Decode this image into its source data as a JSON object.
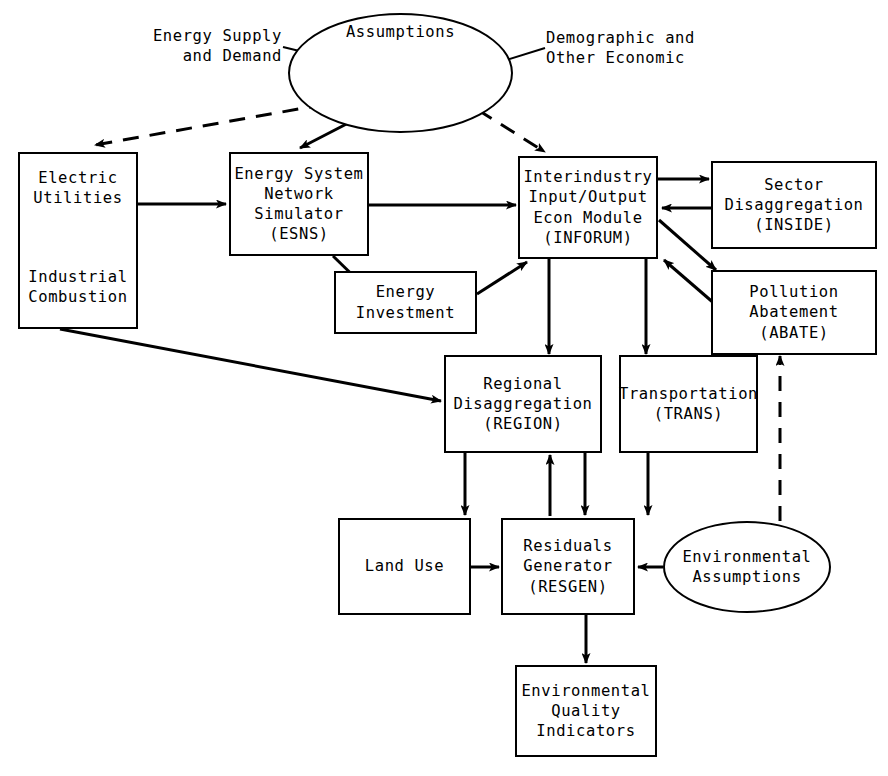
{
  "diagram": {
    "nodes": {
      "assumptions": {
        "label": "Assumptions"
      },
      "energy_supply_label": {
        "label": "Energy Supply\nand Demand"
      },
      "demographic_label": {
        "label": "Demographic and\nOther Economic"
      },
      "electric_utilities": {
        "top": "Electric\nUtilities",
        "bottom": "Industrial\nCombustion"
      },
      "esns": {
        "label": "Energy System\nNetwork\nSimulator\n(ESNS)"
      },
      "inforum": {
        "label": "Interindustry\nInput/Output\nEcon Module\n(INFORUM)"
      },
      "inside": {
        "label": "Sector\nDisaggregation\n(INSIDE)"
      },
      "abate": {
        "label": "Pollution\nAbatement\n(ABATE)"
      },
      "energy_investment": {
        "label": "Energy\nInvestment"
      },
      "region": {
        "label": "Regional\nDisaggregation\n(REGION)"
      },
      "trans": {
        "label": "Transportation\n(TRANS)"
      },
      "land_use": {
        "label": "Land Use"
      },
      "resgen": {
        "label": "Residuals\nGenerator\n(RESGEN)"
      },
      "env_assumptions": {
        "label": "Environmental\nAssumptions"
      },
      "eqi": {
        "label": "Environmental\nQuality\nIndicators"
      }
    },
    "edges": [
      {
        "from": "energy_supply_label",
        "to": "assumptions",
        "style": "solid-leader"
      },
      {
        "from": "demographic_label",
        "to": "assumptions",
        "style": "solid-leader"
      },
      {
        "from": "assumptions",
        "to": "electric_utilities",
        "style": "dashed"
      },
      {
        "from": "assumptions",
        "to": "esns",
        "style": "solid"
      },
      {
        "from": "assumptions",
        "to": "inforum",
        "style": "dashed"
      },
      {
        "from": "electric_utilities",
        "to": "esns",
        "style": "solid"
      },
      {
        "from": "electric_utilities",
        "to": "region",
        "style": "solid"
      },
      {
        "from": "esns",
        "to": "inforum",
        "style": "solid"
      },
      {
        "from": "esns",
        "to": "energy_investment",
        "style": "solid"
      },
      {
        "from": "energy_investment",
        "to": "inforum",
        "style": "solid"
      },
      {
        "from": "inforum",
        "to": "inside",
        "style": "solid"
      },
      {
        "from": "inside",
        "to": "inforum",
        "style": "solid"
      },
      {
        "from": "inforum",
        "to": "abate",
        "style": "solid"
      },
      {
        "from": "abate",
        "to": "inforum",
        "style": "solid"
      },
      {
        "from": "inforum",
        "to": "region",
        "style": "solid"
      },
      {
        "from": "inforum",
        "to": "trans",
        "style": "solid"
      },
      {
        "from": "region",
        "to": "land_use",
        "style": "solid"
      },
      {
        "from": "region",
        "to": "resgen",
        "style": "solid"
      },
      {
        "from": "resgen",
        "to": "region",
        "style": "solid"
      },
      {
        "from": "trans",
        "to": "resgen",
        "style": "solid"
      },
      {
        "from": "land_use",
        "to": "resgen",
        "style": "solid"
      },
      {
        "from": "env_assumptions",
        "to": "resgen",
        "style": "solid"
      },
      {
        "from": "env_assumptions",
        "to": "abate",
        "style": "dashed"
      },
      {
        "from": "resgen",
        "to": "eqi",
        "style": "solid"
      }
    ],
    "colors": {
      "stroke": "#000000",
      "background": "#ffffff"
    }
  }
}
